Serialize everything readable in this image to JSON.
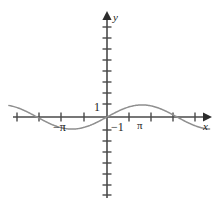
{
  "figure": {
    "kind": "cartesian-plot",
    "background": "#ffffff",
    "axis_color": "#4a4a4a",
    "curve_color": "#8a8a8a",
    "text_color": "#1a1a1a"
  },
  "labels": {
    "y_axis": "y",
    "x_axis": "x",
    "one": "1",
    "negative_one": "−1",
    "negative_pi": "−π",
    "pi": "π"
  },
  "chart_data": {
    "type": "line",
    "title": "",
    "xlabel": "x",
    "ylabel": "y",
    "grid": false,
    "legend": null,
    "annotations": [
      "1",
      "−1",
      "−π",
      "π"
    ],
    "xlim": [
      -4.4,
      4.6
    ],
    "ylim": [
      -4.2,
      4.6
    ],
    "x_ticks": [
      -4,
      -3,
      -2,
      -1,
      0,
      1,
      2,
      3,
      4
    ],
    "x_tick_labels": [
      "",
      "",
      "−π",
      "",
      "",
      "",
      "π",
      "",
      ""
    ],
    "y_ticks": [
      -4,
      -3.5,
      -3,
      -2.5,
      -2,
      -1.5,
      -1,
      -0.5,
      0,
      0.5,
      1,
      1.5,
      2,
      2.5,
      3,
      3.5,
      4
    ],
    "y_tick_labels": [
      "",
      "",
      "",
      "",
      "",
      "",
      "−1",
      "",
      "",
      "",
      "1",
      "",
      "",
      "",
      "",
      "",
      ""
    ],
    "series": [
      {
        "name": "y = sin(x)",
        "equation": "y = sin(x)",
        "amplitude": 0.55,
        "period": 6.2832,
        "phase": 0,
        "x": [
          -4.4,
          -4.0,
          -3.6,
          -3.2,
          -2.8,
          -2.4,
          -2.0,
          -1.6,
          -1.2,
          -0.8,
          -0.4,
          0.0,
          0.4,
          0.8,
          1.2,
          1.6,
          2.0,
          2.4,
          2.8,
          3.2,
          3.6,
          4.0,
          4.4
        ],
        "values": [
          0.52,
          0.42,
          0.24,
          0.03,
          -0.19,
          -0.37,
          -0.5,
          -0.55,
          -0.51,
          -0.39,
          -0.21,
          0.0,
          0.21,
          0.39,
          0.51,
          0.55,
          0.5,
          0.37,
          0.19,
          -0.03,
          -0.24,
          -0.42,
          -0.52
        ]
      }
    ]
  }
}
